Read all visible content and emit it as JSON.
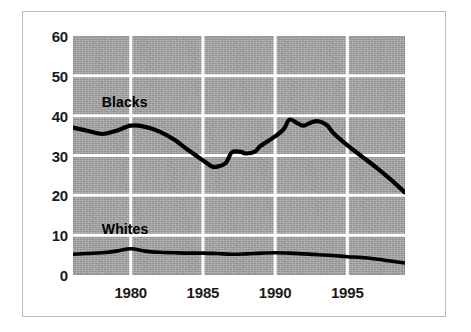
{
  "chart_data": {
    "type": "line",
    "title": "",
    "subtitle": "",
    "xlabel": "",
    "ylabel": "",
    "xlim": [
      1976,
      1999
    ],
    "ylim": [
      0,
      60
    ],
    "grid": true,
    "legend_position": "inline-annotation",
    "x_ticks": [
      "1980",
      "1985",
      "1990",
      "1995"
    ],
    "x_tick_values": [
      1980,
      1985,
      1990,
      1995
    ],
    "y_ticks": [
      "0",
      "10",
      "20",
      "30",
      "40",
      "50",
      "60"
    ],
    "y_tick_values": [
      0,
      10,
      20,
      30,
      40,
      50,
      60
    ],
    "x": [
      1976,
      1977,
      1978,
      1979,
      1980,
      1981,
      1982,
      1983,
      1984,
      1985,
      1986,
      1987,
      1988,
      1989,
      1990,
      1991,
      1992,
      1993,
      1994,
      1995,
      1996,
      1997,
      1998,
      1999
    ],
    "series": [
      {
        "name": "Blacks",
        "color": "#000000",
        "values": [
          37.0,
          36.3,
          35.4,
          36.3,
          37.5,
          37.2,
          35.8,
          34.0,
          31.5,
          29.0,
          27.4,
          27.3,
          29.0,
          31.0,
          30.9,
          31.6,
          33.5,
          35.5,
          37.3,
          39.0,
          38.0,
          38.6,
          38.6,
          36.5
        ]
      },
      {
        "name": "Whites",
        "color": "#000000",
        "values": [
          5.2,
          5.4,
          5.6,
          6.0,
          6.5,
          6.2,
          5.8,
          5.6,
          5.5,
          5.5,
          5.4,
          5.2,
          5.2,
          5.4,
          5.5,
          5.5,
          5.3,
          5.1,
          4.9,
          4.6,
          4.4,
          4.1,
          3.6,
          3.1
        ]
      }
    ],
    "series_blacks_trace": [
      [
        1976,
        37.0
      ],
      [
        1977,
        36.2
      ],
      [
        1978,
        35.4
      ],
      [
        1979,
        36.2
      ],
      [
        1980,
        37.5
      ],
      [
        1981,
        37.2
      ],
      [
        1982,
        36.0
      ],
      [
        1983,
        34.0
      ],
      [
        1984,
        31.3
      ],
      [
        1985,
        28.8
      ],
      [
        1985.6,
        27.3
      ],
      [
        1986,
        27.2
      ],
      [
        1986.6,
        28.2
      ],
      [
        1987,
        30.8
      ],
      [
        1987.6,
        30.9
      ],
      [
        1988,
        30.5
      ],
      [
        1988.6,
        31.0
      ],
      [
        1989,
        32.4
      ],
      [
        1990,
        34.8
      ],
      [
        1990.6,
        36.6
      ],
      [
        1991,
        39.0
      ],
      [
        1991.6,
        38.0
      ],
      [
        1992,
        37.5
      ],
      [
        1992.5,
        38.3
      ],
      [
        1993,
        38.6
      ],
      [
        1993.6,
        37.6
      ],
      [
        1994,
        35.8
      ],
      [
        1995,
        32.6
      ],
      [
        1996,
        29.8
      ],
      [
        1997,
        27.0
      ],
      [
        1998,
        24.0
      ],
      [
        1999,
        20.7
      ]
    ],
    "series_whites_trace": [
      [
        1976,
        5.2
      ],
      [
        1977,
        5.4
      ],
      [
        1978,
        5.6
      ],
      [
        1979,
        6.0
      ],
      [
        1980,
        6.6
      ],
      [
        1981,
        6.0
      ],
      [
        1982,
        5.7
      ],
      [
        1983,
        5.6
      ],
      [
        1984,
        5.5
      ],
      [
        1985,
        5.5
      ],
      [
        1986,
        5.4
      ],
      [
        1987,
        5.2
      ],
      [
        1988,
        5.3
      ],
      [
        1989,
        5.5
      ],
      [
        1990,
        5.6
      ],
      [
        1991,
        5.5
      ],
      [
        1992,
        5.3
      ],
      [
        1993,
        5.1
      ],
      [
        1994,
        4.9
      ],
      [
        1995,
        4.6
      ],
      [
        1996,
        4.4
      ],
      [
        1997,
        4.0
      ],
      [
        1998,
        3.5
      ],
      [
        1999,
        3.0
      ]
    ],
    "annotations": [
      {
        "text": "Blacks",
        "x": 1978.0,
        "y": 43.5
      },
      {
        "text": "Whites",
        "x": 1978.0,
        "y": 11.5
      }
    ],
    "colors": {
      "plot_background": "#a3a3a3",
      "gridline": "#ffffff",
      "line": "#000000",
      "text": "#1a1a1a",
      "frame": "#b9b9b9",
      "page_background": "#ffffff"
    }
  }
}
